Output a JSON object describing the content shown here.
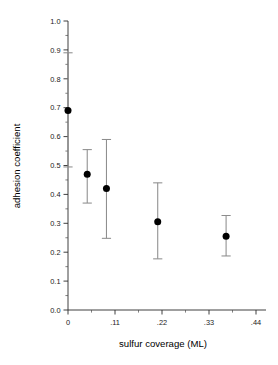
{
  "chart_data": {
    "type": "scatter",
    "title": "",
    "subtitle": "",
    "xlabel": "sulfur coverage (ML)",
    "ylabel": "adhesion coefficient",
    "xlim": [
      -0.03,
      0.47
    ],
    "ylim": [
      0.0,
      1.0
    ],
    "grid": false,
    "legend": false,
    "legend_position": "none",
    "error_bars": "asymmetric vertical",
    "x_tick_labels": [
      "0",
      ".11",
      ".22",
      ".33",
      ".44"
    ],
    "x_tick_values": [
      0,
      0.11,
      0.22,
      0.33,
      0.44
    ],
    "x_minor_tick_values": [
      0.055,
      0.165,
      0.275,
      0.385
    ],
    "y_tick_labels": [
      "0.0",
      "0.1",
      "0.2",
      "0.3",
      "0.4",
      "0.5",
      "0.6",
      "0.7",
      "0.8",
      "0.9",
      "1.0"
    ],
    "y_tick_values": [
      0.0,
      0.1,
      0.2,
      0.3,
      0.4,
      0.5,
      0.6,
      0.7,
      0.8,
      0.9,
      1.0
    ],
    "y_minor_tick_values": [
      0.05,
      0.15,
      0.25,
      0.35,
      0.45,
      0.55,
      0.65,
      0.75,
      0.85,
      0.95
    ],
    "marker_style": "filled-circle",
    "marker_color": "#000000",
    "errorbar_color": "#8d8d8d",
    "axis_color": "#2b2b2b",
    "x": [
      0.0,
      0.045,
      0.09,
      0.21,
      0.37
    ],
    "y": [
      0.69,
      0.47,
      0.42,
      0.305,
      0.255
    ],
    "y_err_low": [
      0.495,
      0.37,
      0.248,
      0.177,
      0.187
    ],
    "y_err_high": [
      0.89,
      0.555,
      0.59,
      0.44,
      0.327
    ],
    "points": [
      {
        "x": 0.0,
        "y": 0.69,
        "low": 0.495,
        "high": 0.89
      },
      {
        "x": 0.045,
        "y": 0.47,
        "low": 0.37,
        "high": 0.555
      },
      {
        "x": 0.09,
        "y": 0.42,
        "low": 0.248,
        "high": 0.59
      },
      {
        "x": 0.21,
        "y": 0.305,
        "low": 0.177,
        "high": 0.44
      },
      {
        "x": 0.37,
        "y": 0.255,
        "low": 0.187,
        "high": 0.327
      }
    ]
  }
}
